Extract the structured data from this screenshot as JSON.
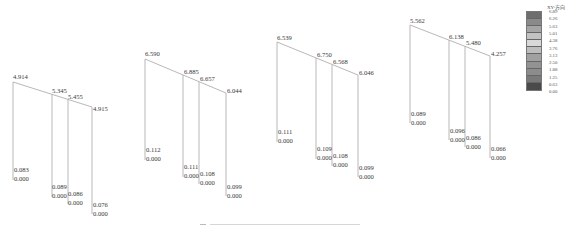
{
  "legend": {
    "title": "XY-方向",
    "values": [
      "6.89",
      "6.26",
      "5.63",
      "5.01",
      "4.38",
      "3.76",
      "3.13",
      "2.50",
      "1.88",
      "1.25",
      "0.63",
      "0.00"
    ],
    "band_colors": [
      "#6e6e6e",
      "#8a8a8a",
      "#a5a5a5",
      "#c2c2c2",
      "#d8d8d8",
      "#bdbdbd",
      "#a0a0a0",
      "#929292",
      "#8c8c8c",
      "#7a7a7a",
      "#4a4a4a"
    ]
  },
  "frames": [
    {
      "name": "frame-1",
      "top_values": [
        "4.914",
        "5.345",
        "5.455",
        "4.915"
      ],
      "column_values": [
        [
          "0.083",
          "0.000"
        ],
        [
          "0.089",
          "0.000"
        ],
        [
          "0.086",
          "0.000"
        ],
        [
          "0.076",
          "0.000"
        ]
      ]
    },
    {
      "name": "frame-2",
      "top_values": [
        "6.590",
        "6.885",
        "6.657",
        "6.044"
      ],
      "column_values": [
        [
          "0.112",
          "0.000"
        ],
        [
          "0.111",
          "0.000"
        ],
        [
          "0.108",
          "0.000"
        ],
        [
          "0.099",
          "0.000"
        ]
      ]
    },
    {
      "name": "frame-3",
      "top_values": [
        "6.539",
        "6.750",
        "6.568",
        "6.046"
      ],
      "column_values": [
        [
          "0.111",
          "0.000"
        ],
        [
          "0.109",
          "0.000"
        ],
        [
          "0.108",
          "0.000"
        ],
        [
          "0.099",
          "0.000"
        ]
      ]
    },
    {
      "name": "frame-4",
      "top_values": [
        "5.562",
        "6.138",
        "5.480",
        "4.257"
      ],
      "column_values": [
        [
          "0.089",
          "0.000"
        ],
        [
          "0.096",
          "0.000"
        ],
        [
          "0.086",
          "0.000"
        ],
        [
          "0.066",
          "0.000"
        ]
      ]
    }
  ],
  "colors": {
    "beam": "#b0b0b0",
    "column": "#a8a8a8"
  }
}
